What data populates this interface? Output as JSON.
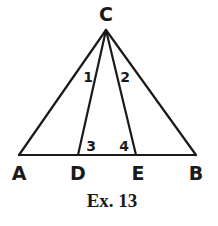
{
  "diagram": {
    "points": {
      "C": {
        "label": "C",
        "x": 106,
        "y": 30
      },
      "A": {
        "label": "A",
        "x": 19,
        "y": 155
      },
      "D": {
        "label": "D",
        "x": 78,
        "y": 155
      },
      "E": {
        "label": "E",
        "x": 136,
        "y": 155
      },
      "B": {
        "label": "B",
        "x": 196,
        "y": 155
      }
    },
    "segments": [
      "CA",
      "CD",
      "CE",
      "CB",
      "AB"
    ],
    "angles": {
      "a1": {
        "label": "1"
      },
      "a2": {
        "label": "2"
      },
      "a3": {
        "label": "3"
      },
      "a4": {
        "label": "4"
      }
    },
    "caption": "Ex. 13",
    "stroke_color": "#1a1a1a"
  }
}
